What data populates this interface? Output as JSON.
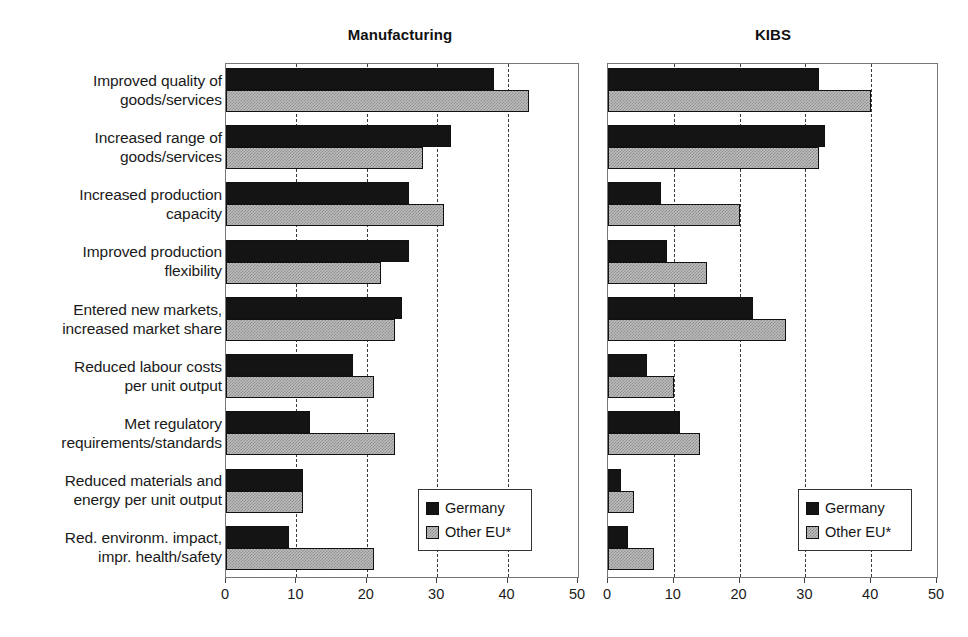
{
  "chart_data": {
    "type": "bar",
    "orientation": "horizontal",
    "title": "",
    "categories": [
      "Improved quality of\ngoods/services",
      "Increased range of\ngoods/services",
      "Increased production\ncapacity",
      "Improved production\nflexibility",
      "Entered new markets,\nincreased market share",
      "Reduced labour costs\nper unit output",
      "Met regulatory\nrequirements/standards",
      "Reduced materials and\nenergy per unit output",
      "Red. environm. impact,\nimpr. health/safety"
    ],
    "xlabel": "",
    "ylabel": "",
    "xlim": [
      0,
      50
    ],
    "xticks": [
      0,
      10,
      20,
      30,
      40,
      50
    ],
    "xtick_labels": [
      "0",
      "10",
      "20",
      "30",
      "40",
      "50"
    ],
    "grid": "vertical-dashed",
    "legend_position": "lower-right-inside",
    "legend_entries": [
      "Germany",
      "Other EU*"
    ],
    "panels": [
      {
        "title": "Manufacturing",
        "series": [
          {
            "name": "Germany",
            "values": [
              38,
              32,
              26,
              26,
              25,
              18,
              12,
              11,
              9
            ]
          },
          {
            "name": "Other EU*",
            "values": [
              43,
              28,
              31,
              22,
              24,
              21,
              24,
              11,
              21
            ]
          }
        ]
      },
      {
        "title": "KIBS",
        "series": [
          {
            "name": "Germany",
            "values": [
              32,
              33,
              8,
              9,
              22,
              6,
              11,
              2,
              3
            ]
          },
          {
            "name": "Other EU*",
            "values": [
              40,
              32,
              20,
              15,
              27,
              10,
              14,
              4,
              7
            ]
          }
        ]
      }
    ]
  },
  "colors": {
    "germany": "#141414",
    "other_eu": "#bdbdbd",
    "axis": "#3b3b3b",
    "text": "#1a1a1a"
  }
}
